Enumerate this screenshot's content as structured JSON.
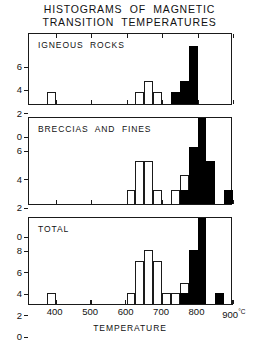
{
  "figure": {
    "title_lines": [
      "HISTOGRAMS  OF  MAGNETIC",
      "TRANSITION  TEMPERATURES"
    ],
    "xlabel": "TEMPERATURE",
    "x_unit": "°C"
  },
  "axis": {
    "x_ticks": [
      {
        "value": 400,
        "label": "400"
      },
      {
        "value": 500,
        "label": "500"
      },
      {
        "value": 600,
        "label": "600"
      },
      {
        "value": 700,
        "label": "700"
      },
      {
        "value": 800,
        "label": "800"
      },
      {
        "value": 900,
        "label": "900"
      }
    ],
    "x_min": 325,
    "x_max": 900,
    "x_last_label_suffix": "°C"
  },
  "chart_data": {
    "type": "bar",
    "title": "HISTOGRAMS OF MAGNETIC TRANSITION TEMPERATURES",
    "xlabel": "TEMPERATURE",
    "x_unit": "°C",
    "xlim": [
      325,
      900
    ],
    "bin_width": 25,
    "grid": false,
    "legend": null,
    "panels": [
      {
        "name": "igneous-rocks",
        "label": "IGNEOUS  ROCKS",
        "ylim": [
          0,
          6
        ],
        "y_ticks": [
          0,
          2,
          4,
          6
        ],
        "ylabel": "",
        "bars": [
          {
            "x0": 375,
            "x1": 400,
            "value": 1,
            "fill": "open"
          },
          {
            "x0": 625,
            "x1": 650,
            "value": 1,
            "fill": "open"
          },
          {
            "x0": 650,
            "x1": 675,
            "value": 2,
            "fill": "open"
          },
          {
            "x0": 675,
            "x1": 700,
            "value": 1,
            "fill": "open"
          },
          {
            "x0": 725,
            "x1": 750,
            "value": 1,
            "fill": "filled"
          },
          {
            "x0": 750,
            "x1": 775,
            "value": 2,
            "fill": "filled"
          },
          {
            "x0": 775,
            "x1": 800,
            "value": 5,
            "fill": "filled"
          }
        ]
      },
      {
        "name": "breccias-and-fines",
        "label": "BRECCIAS  AND  FINES",
        "ylim": [
          0,
          6
        ],
        "y_ticks": [
          0,
          2,
          4,
          6
        ],
        "ylabel": "",
        "bars": [
          {
            "x0": 600,
            "x1": 625,
            "value": 1,
            "fill": "open"
          },
          {
            "x0": 625,
            "x1": 650,
            "value": 3,
            "fill": "open"
          },
          {
            "x0": 650,
            "x1": 675,
            "value": 3,
            "fill": "open"
          },
          {
            "x0": 675,
            "x1": 700,
            "value": 1,
            "fill": "open"
          },
          {
            "x0": 725,
            "x1": 750,
            "value": 1,
            "fill": "open"
          },
          {
            "x0": 750,
            "x1": 775,
            "value": 2,
            "fill": "open"
          },
          {
            "x0": 750,
            "x1": 775,
            "value": 1,
            "fill": "filled"
          },
          {
            "x0": 775,
            "x1": 800,
            "value": 4,
            "fill": "filled"
          },
          {
            "x0": 800,
            "x1": 825,
            "value": 6,
            "fill": "filled"
          },
          {
            "x0": 825,
            "x1": 850,
            "value": 3,
            "fill": "filled"
          },
          {
            "x0": 875,
            "x1": 900,
            "value": 1,
            "fill": "filled"
          }
        ]
      },
      {
        "name": "total",
        "label": "TOTAL",
        "ylim": [
          0,
          8
        ],
        "y_ticks": [
          0,
          2,
          4,
          6,
          8
        ],
        "ylabel": "",
        "bars": [
          {
            "x0": 375,
            "x1": 400,
            "value": 1,
            "fill": "open"
          },
          {
            "x0": 600,
            "x1": 625,
            "value": 1,
            "fill": "open"
          },
          {
            "x0": 625,
            "x1": 650,
            "value": 4,
            "fill": "open"
          },
          {
            "x0": 650,
            "x1": 675,
            "value": 5,
            "fill": "open"
          },
          {
            "x0": 675,
            "x1": 700,
            "value": 4,
            "fill": "open"
          },
          {
            "x0": 700,
            "x1": 725,
            "value": 1,
            "fill": "open"
          },
          {
            "x0": 725,
            "x1": 750,
            "value": 1,
            "fill": "open"
          },
          {
            "x0": 750,
            "x1": 775,
            "value": 2,
            "fill": "open"
          },
          {
            "x0": 750,
            "x1": 775,
            "value": 1,
            "fill": "filled"
          },
          {
            "x0": 775,
            "x1": 800,
            "value": 5,
            "fill": "filled"
          },
          {
            "x0": 800,
            "x1": 825,
            "value": 8,
            "fill": "filled"
          },
          {
            "x0": 850,
            "x1": 875,
            "value": 1,
            "fill": "filled"
          }
        ]
      }
    ]
  }
}
